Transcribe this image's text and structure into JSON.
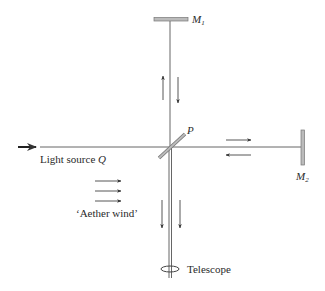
{
  "diagram": {
    "labels": {
      "mirror1": "M",
      "mirror1_sub": "1",
      "mirror2": "M",
      "mirror2_sub": "2",
      "splitter": "P",
      "light_source": "Light source ",
      "light_source_symbol": "Q",
      "aether_wind": "‘Aether wind’",
      "telescope": "Telescope"
    },
    "colors": {
      "line": "#555555",
      "arrow": "#333333",
      "text": "#2a2a2a"
    }
  }
}
